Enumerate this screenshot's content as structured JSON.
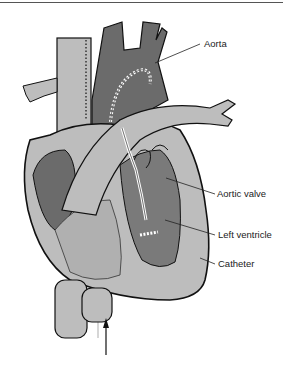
{
  "diagram": {
    "type": "anatomical-illustration",
    "labels": [
      {
        "id": "aorta",
        "text": "Aorta"
      },
      {
        "id": "aortic_valve",
        "text": "Aortic valve"
      },
      {
        "id": "left_ventricle",
        "text": "Left ventricle"
      },
      {
        "id": "catheter",
        "text": "Catheter"
      }
    ],
    "colors": {
      "light_tissue": "#bdbdbd",
      "dark_tissue": "#6b6b6b",
      "mid_tissue": "#9a9a9a",
      "outline": "#111111",
      "catheter": "#ffffff"
    }
  }
}
